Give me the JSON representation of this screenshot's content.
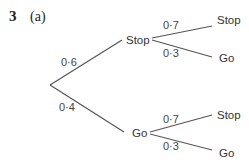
{
  "question": {
    "number": "3",
    "part": "(a)"
  },
  "tree": {
    "root_branches": [
      {
        "prob": "0·6",
        "outcome": "Stop",
        "children": [
          {
            "prob": "0·7",
            "outcome": "Stop"
          },
          {
            "prob": "0·3",
            "outcome": "Go"
          }
        ]
      },
      {
        "prob": "0·4",
        "outcome": "Go",
        "children": [
          {
            "prob": "0·7",
            "outcome": "Stop"
          },
          {
            "prob": "0·3",
            "outcome": "Go"
          }
        ]
      }
    ]
  }
}
